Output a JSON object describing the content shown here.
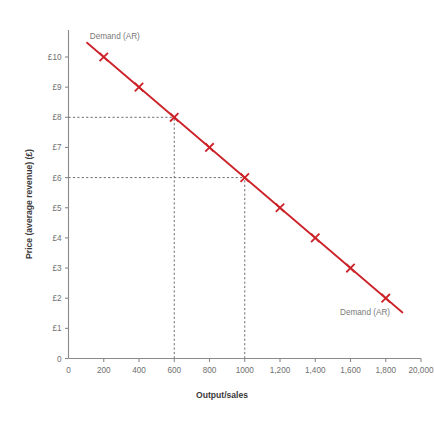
{
  "chart_data": {
    "type": "line",
    "title": "",
    "xlabel": "Output/sales",
    "ylabel": "Price (average revenue) (£)",
    "xlim": [
      0,
      2000
    ],
    "ylim": [
      0,
      10.5
    ],
    "grid": false,
    "legend_position": "inline-annotations",
    "series": [
      {
        "name": "Demand (AR)",
        "color": "#cc2229",
        "marker": "x",
        "x": [
          200,
          400,
          600,
          800,
          1000,
          1200,
          1400,
          1600,
          1800
        ],
        "values": [
          10,
          9,
          8,
          7,
          6,
          5,
          4,
          3,
          2
        ]
      }
    ],
    "x_tick_labels": [
      "0",
      "200",
      "400",
      "600",
      "800",
      "1000",
      "1,200",
      "1,400",
      "1,600",
      "1,800",
      "20,000"
    ],
    "x_tick_values": [
      0,
      200,
      400,
      600,
      800,
      1000,
      1200,
      1400,
      1600,
      1800,
      2000
    ],
    "y_tick_labels": [
      "0",
      "£1",
      "£2",
      "£3",
      "£4",
      "£5",
      "£6",
      "£7",
      "£8",
      "£9",
      "£10"
    ],
    "y_tick_values": [
      0,
      1,
      2,
      3,
      4,
      5,
      6,
      7,
      8,
      9,
      10
    ],
    "annotations": [
      {
        "text": "Demand (AR)",
        "x": 200,
        "y": 10.6,
        "position": "top-left"
      },
      {
        "text": "Demand (AR)",
        "x": 1620,
        "y": 1.45,
        "position": "bottom-right"
      }
    ],
    "guide_lines": [
      {
        "orientation": "horizontal",
        "y": 8,
        "from_x": 0,
        "to_x": 600,
        "style": "dashed"
      },
      {
        "orientation": "horizontal",
        "y": 6,
        "from_x": 0,
        "to_x": 1000,
        "style": "dashed"
      },
      {
        "orientation": "vertical",
        "x": 600,
        "from_y": 0,
        "to_y": 8,
        "style": "dashed"
      },
      {
        "orientation": "vertical",
        "x": 1000,
        "from_y": 0,
        "to_y": 6,
        "style": "dashed"
      }
    ],
    "colors": {
      "series": "#cc2229",
      "axis": "#8a8a8a",
      "tick_text": "#6f6f6f",
      "title_text": "#3a3a3a",
      "guide": "#6d6d6d",
      "background": "#ffffff"
    }
  }
}
